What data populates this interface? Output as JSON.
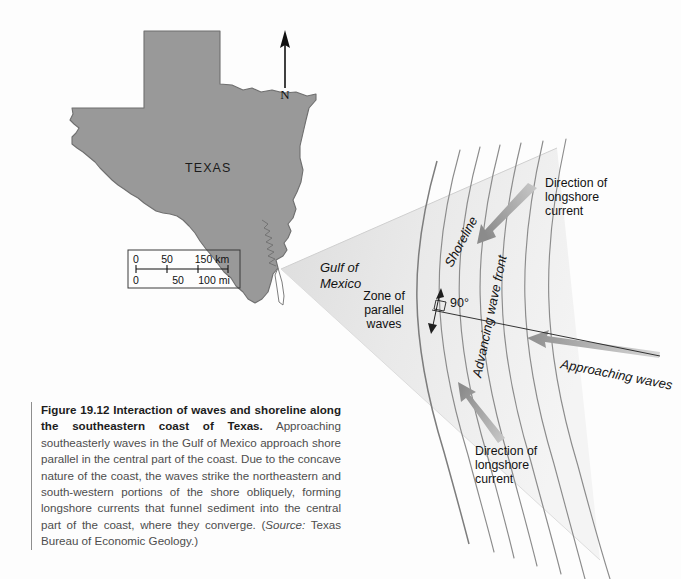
{
  "figure": {
    "map": {
      "state_label": "TEXAS",
      "water_label_line1": "Gulf of",
      "water_label_line2": "Mexico",
      "north_letter": "N",
      "scale": {
        "km_ticks": [
          "0",
          "50",
          "150 km"
        ],
        "mi_ticks": [
          "0",
          "50",
          "100 mi"
        ]
      }
    },
    "diagram": {
      "shoreline_label": "Shoreline",
      "advancing_wave_front_label": "Advancing wave front",
      "approaching_waves_label": "Approaching waves",
      "angle_label": "90°",
      "zone_label": {
        "line1": "Zone of",
        "line2": "parallel",
        "line3": "waves"
      },
      "longshore_top": {
        "line1": "Direction of",
        "line2": "longshore",
        "line3": "current"
      },
      "longshore_bottom": {
        "line1": "Direction of",
        "line2": "longshore",
        "line3": "current"
      }
    },
    "caption": {
      "title": "Figure 19.12 Interaction of waves and shoreline along the southeastern coast of Texas.",
      "body_part1": " Approaching southeasterly waves in the Gulf of Mexico approach shore parallel in the central part of the coast. Due to the concave nature of the coast, the waves strike the northeastern and south-western portions of the shore obliquely, forming longshore currents that funnel sediment into the central part of the coast, where they converge. (",
      "source_label": "Source:",
      "body_part2": " Texas Bureau of Economic Geology.)"
    }
  },
  "colors": {
    "land_fill": "#999999",
    "land_stroke": "#6e6e6e",
    "water_wedge": "#e9e9e9",
    "wave_line": "#8c8c8c",
    "arrow_fill": "#9a9a9a",
    "text_dark": "#121212",
    "caption_text": "#4d4d4d"
  }
}
